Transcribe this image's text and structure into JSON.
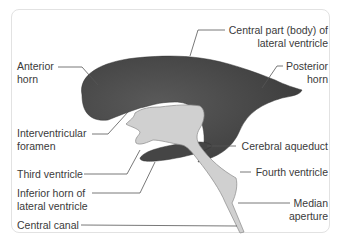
{
  "diagram": {
    "colors": {
      "lateral_ventricle": "#4a4a4a",
      "third_ventricle_and_aqueduct": "#cfcfcf",
      "outline": "#8a8a8a",
      "leader_lines": "#555555",
      "label_text": "#3a3a3a",
      "frame_border": "#e2e2e2"
    },
    "labels": {
      "anterior_horn": [
        "Anterior",
        "horn"
      ],
      "central_part": [
        "Central part (body) of",
        "lateral ventricle"
      ],
      "posterior_horn": [
        "Posterior",
        "horn"
      ],
      "interventricular_foramen": [
        "Interventricular",
        "foramen"
      ],
      "cerebral_aqueduct": "Cerebral aqueduct",
      "third_ventricle": "Third ventricle",
      "fourth_ventricle": "Fourth ventricle",
      "inferior_horn": [
        "Inferior horn of",
        "lateral ventricle"
      ],
      "median_aperture": [
        "Median",
        "aperture"
      ],
      "central_canal": "Central canal"
    }
  }
}
